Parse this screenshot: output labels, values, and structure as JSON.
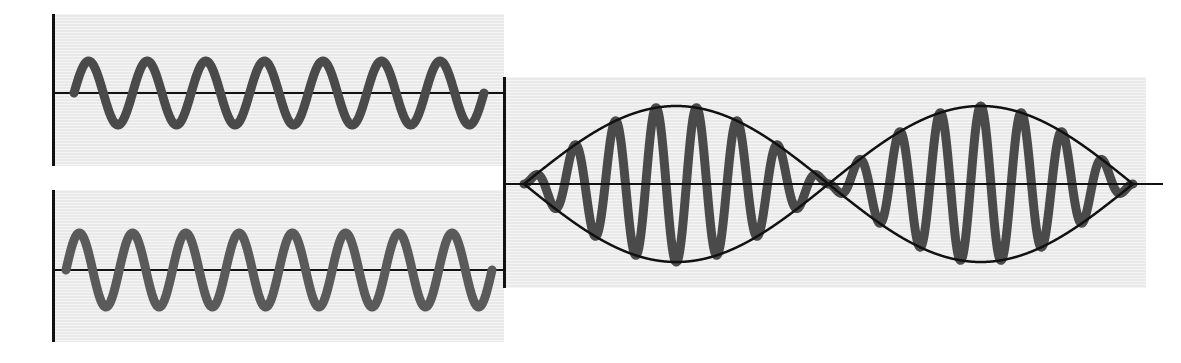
{
  "figure": {
    "background_color": "#ffffff",
    "panel_background_color": "#e9e9e9",
    "axis_color": "#111111",
    "wave_color_a": "#4a4a4a",
    "wave_color_b": "#5a5a5a",
    "resultant_wave_color": "#4a4a4a",
    "envelope_color": "#111111"
  },
  "panels": [
    {
      "id": "wave-a",
      "name": "upper-left-wave-panel",
      "role": "first source wave",
      "x": 52,
      "y": 14,
      "width": 452,
      "height": 152,
      "axis_y": 79,
      "wave_start_x": 22,
      "wave_end_x": 432,
      "axis_end_x": 452,
      "cycles": 7,
      "amplitude_px": 32,
      "phase_deg": 0,
      "stroke_width": 9,
      "color": "#4a4a4a"
    },
    {
      "id": "wave-b",
      "name": "lower-left-wave-panel",
      "role": "second source wave, slightly higher frequency",
      "x": 52,
      "y": 190,
      "width": 452,
      "height": 152,
      "axis_y": 80,
      "wave_start_x": 14,
      "wave_end_x": 440,
      "axis_end_x": 452,
      "cycles": 8,
      "amplitude_px": 37,
      "phase_deg": 0,
      "stroke_width": 9,
      "color": "#5a5a5a"
    },
    {
      "id": "beats",
      "name": "beats-resultant-panel",
      "role": "resultant superposition showing beats",
      "x": 503,
      "y": 77,
      "width": 643,
      "height": 211,
      "axis_y": 107,
      "wave_start_x": 21,
      "wave_end_x": 630,
      "axis_end_x": 660,
      "beat_count": 2,
      "beat_period_px": 304,
      "node_positions_px": [
        21,
        325,
        629
      ],
      "carrier_cycles_per_beat": 7.5,
      "max_amplitude_px": 78,
      "stroke_width": 9,
      "envelope_stroke_width": 2.5,
      "color": "#4a4a4a",
      "envelope_color": "#111111"
    }
  ],
  "chart_data": {
    "type": "line",
    "xlabel": "",
    "ylabel": "",
    "grid": false,
    "legend": "none",
    "series": [
      {
        "name": "Wave 1 (lower frequency)",
        "panel": "wave-a",
        "waveform": "sine",
        "cycles_shown": 7,
        "amplitude": 1.0,
        "frequency_relative": 7,
        "color": "#4a4a4a"
      },
      {
        "name": "Wave 2 (higher frequency)",
        "panel": "wave-b",
        "waveform": "sine",
        "cycles_shown": 8,
        "amplitude": 1.0,
        "frequency_relative": 8,
        "color": "#5a5a5a"
      },
      {
        "name": "Resultant (sum) with beat envelope",
        "panel": "beats",
        "waveform": "sine-sum",
        "carrier_frequency_relative": 7.5,
        "beat_frequency_relative": 1,
        "beats_shown": 2,
        "amplitude": 2.0,
        "color": "#4a4a4a",
        "envelope": {
          "name": "beat envelope",
          "type": "cosine",
          "color": "#111111",
          "amplitude": 2.0
        }
      }
    ]
  }
}
